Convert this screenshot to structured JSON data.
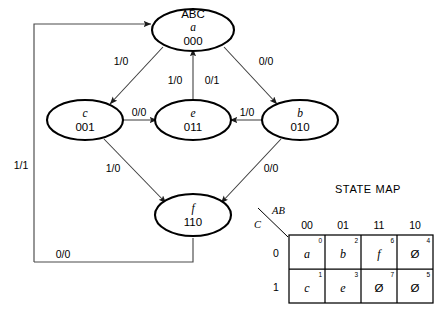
{
  "diagram": {
    "header_label": "ABC",
    "states": [
      {
        "id": "a",
        "name": "a",
        "code": "000",
        "cx": 193,
        "cy": 30
      },
      {
        "id": "c",
        "name": "c",
        "code": "001",
        "cx": 85,
        "cy": 120
      },
      {
        "id": "e",
        "name": "e",
        "code": "011",
        "cx": 193,
        "cy": 120
      },
      {
        "id": "b",
        "name": "b",
        "code": "010",
        "cx": 300,
        "cy": 120
      },
      {
        "id": "f",
        "name": "f",
        "code": "110",
        "cx": 193,
        "cy": 215
      }
    ],
    "transitions": [
      {
        "from": "a",
        "to": "c",
        "label": "1/0"
      },
      {
        "from": "a",
        "to": "b",
        "label": "0/0"
      },
      {
        "from": "c",
        "to": "e",
        "label": "0/0"
      },
      {
        "from": "b",
        "to": "e",
        "label": "1/0"
      },
      {
        "from": "e",
        "to": "a",
        "label": "1/0"
      },
      {
        "from": "e",
        "to": "a",
        "label": "0/1"
      },
      {
        "from": "c",
        "to": "f",
        "label": "1/0"
      },
      {
        "from": "b",
        "to": "f",
        "label": "0/0"
      },
      {
        "from": "e",
        "to": "a",
        "label": "1/1"
      },
      {
        "from": "f",
        "to": "a",
        "label": "0/0"
      }
    ],
    "edge_labels": {
      "a_to_c": "1/0",
      "a_to_b": "0/0",
      "e_to_a_left": "1/0",
      "e_to_a_right": "0/1",
      "c_to_e": "0/0",
      "b_to_e": "1/0",
      "c_to_f": "1/0",
      "b_to_f": "0/0",
      "feedback_left": "1/1",
      "feedback_bottom": "0/0"
    }
  },
  "state_map": {
    "title": "STATE MAP",
    "col_axis_label": "AB",
    "row_axis_label": "C",
    "col_headers": [
      "00",
      "01",
      "11",
      "10"
    ],
    "row_headers": [
      "0",
      "1"
    ],
    "rows": [
      {
        "header": "0",
        "cells": [
          {
            "index": "0",
            "value": "a",
            "dontcare": false
          },
          {
            "index": "2",
            "value": "b",
            "dontcare": false
          },
          {
            "index": "6",
            "value": "f",
            "dontcare": false
          },
          {
            "index": "4",
            "value": "Ø",
            "dontcare": true
          }
        ]
      },
      {
        "header": "1",
        "cells": [
          {
            "index": "1",
            "value": "c",
            "dontcare": false
          },
          {
            "index": "3",
            "value": "e",
            "dontcare": false
          },
          {
            "index": "7",
            "value": "Ø",
            "dontcare": true
          },
          {
            "index": "5",
            "value": "Ø",
            "dontcare": true
          }
        ]
      }
    ]
  }
}
